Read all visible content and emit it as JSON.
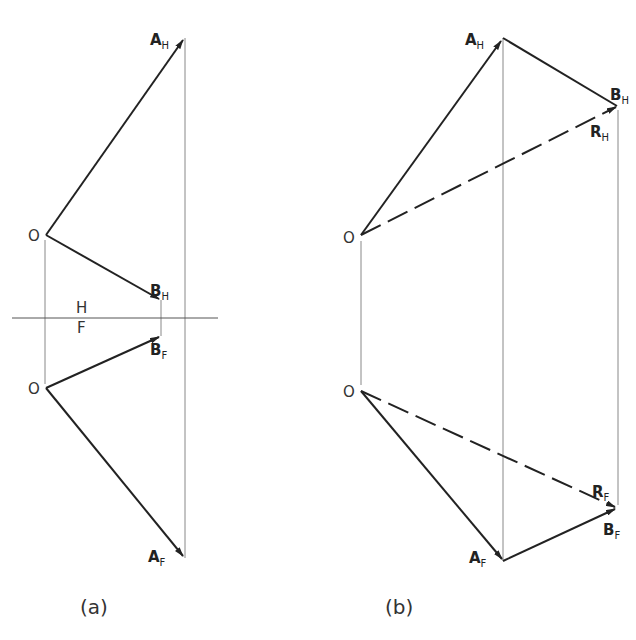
{
  "figure": {
    "a": {
      "caption": "(a)",
      "labels": {
        "O_top": "O",
        "O_bottom": "O",
        "A_H": "A",
        "A_H_sub": "H",
        "B_H": "B",
        "B_H_sub": "H",
        "B_F": "B",
        "B_F_sub": "F",
        "A_F": "A",
        "A_F_sub": "F",
        "plane_H": "H",
        "plane_F": "F"
      }
    },
    "b": {
      "caption": "(b)",
      "labels": {
        "O_top": "O",
        "O_bottom": "O",
        "A_H": "A",
        "A_H_sub": "H",
        "B_H": "B",
        "B_H_sub": "H",
        "R_H": "R",
        "R_H_sub": "H",
        "R_F": "R",
        "R_F_sub": "F",
        "B_F": "B",
        "B_F_sub": "F",
        "A_F": "A",
        "A_F_sub": "F"
      }
    },
    "colors": {
      "vector": "#222222",
      "projector": "#888888"
    }
  }
}
